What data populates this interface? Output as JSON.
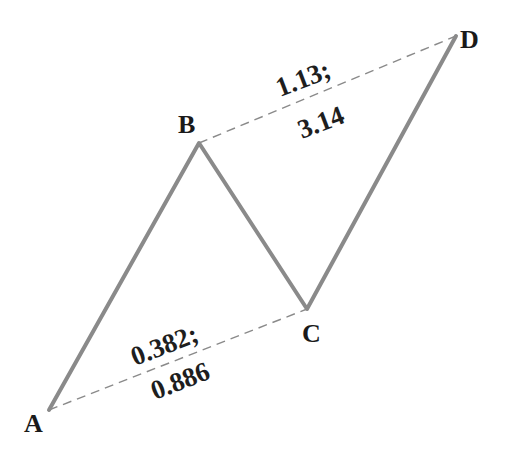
{
  "diagram": {
    "title": "",
    "colors": {
      "legs": "#8a8a8a",
      "dashed": "#8a8a8a",
      "text": "#1a1a1a",
      "background": "#ffffff"
    },
    "points": [
      {
        "label": "A",
        "x": 49,
        "y": 410
      },
      {
        "label": "B",
        "x": 199,
        "y": 143
      },
      {
        "label": "C",
        "x": 307,
        "y": 309
      },
      {
        "label": "D",
        "x": 456,
        "y": 36
      }
    ],
    "legs": [
      {
        "from": "A",
        "to": "B"
      },
      {
        "from": "B",
        "to": "C"
      },
      {
        "from": "C",
        "to": "D"
      }
    ],
    "ratio_lines": [
      {
        "from": "A",
        "to": "C",
        "line1": "0.382;",
        "line2": "0.886"
      },
      {
        "from": "B",
        "to": "D",
        "line1": "1.13;",
        "line2": "3.14"
      }
    ]
  }
}
